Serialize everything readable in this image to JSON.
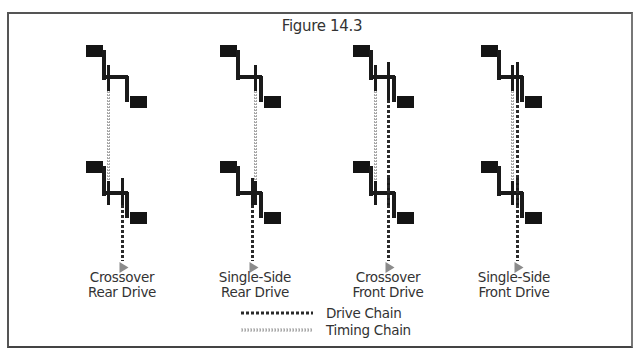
{
  "title": "Figure 14.3",
  "colors": {
    "crank": "#1a1a1a",
    "pedal": "#141414",
    "drive_chain": "#2a2a2a",
    "timing_chain": "#a8a8a8",
    "arrow": "#8c8c8c",
    "text": "#333333"
  },
  "configurations": [
    {
      "id": "crossover-rear",
      "label_line1": "Crossover",
      "label_line2": "Rear Drive",
      "timing_chain": "left",
      "drive_chain": "right-rear"
    },
    {
      "id": "single-side-rear",
      "label_line1": "Single-Side",
      "label_line2": "Rear Drive",
      "timing_chain": "right",
      "drive_chain": "right-rear"
    },
    {
      "id": "crossover-front",
      "label_line1": "Crossover",
      "label_line2": "Front Drive",
      "timing_chain": "left",
      "drive_chain": "right-front"
    },
    {
      "id": "single-side-front",
      "label_line1": "Single-Side",
      "label_line2": "Front Drive",
      "timing_chain": "right",
      "drive_chain": "right-front"
    }
  ],
  "legend": {
    "drive_chain_label": "Drive Chain",
    "timing_chain_label": "Timing Chain"
  }
}
